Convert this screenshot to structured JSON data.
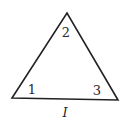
{
  "diagram": {
    "shape": "triangle",
    "vertices": [
      {
        "id": "left",
        "x": 12,
        "y": 98
      },
      {
        "id": "apex",
        "x": 67,
        "y": 13
      },
      {
        "id": "right",
        "x": 118,
        "y": 100
      }
    ],
    "angle_labels": [
      {
        "text": "1",
        "x": 32,
        "y": 94
      },
      {
        "text": "2",
        "x": 66,
        "y": 37
      },
      {
        "text": "3",
        "x": 97,
        "y": 95
      }
    ],
    "side_label": {
      "text": "I",
      "x": 65,
      "y": 117
    },
    "stroke_color": "#222222",
    "label_color": "#2a2a2a"
  }
}
